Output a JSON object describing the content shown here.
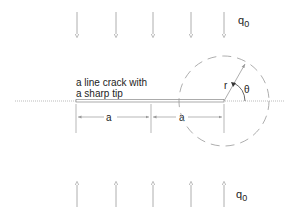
{
  "diagram": {
    "title": "",
    "load_label_top": "q",
    "load_label_top_sub": "0",
    "load_label_bottom": "q",
    "load_label_bottom_sub": "0",
    "crack_label_line1": "a line crack with",
    "crack_label_line2": "a sharp tip",
    "dim_left": "a",
    "dim_right": "a",
    "radius_label": "r",
    "angle_label": "θ",
    "arrow_x_positions": [
      77,
      116,
      153,
      191,
      224
    ],
    "colors": {
      "line": "#999999",
      "text": "#222222",
      "crack": "#888888"
    }
  }
}
